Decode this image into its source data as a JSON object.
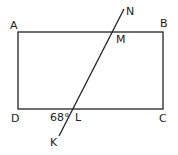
{
  "figure": {
    "type": "geometry",
    "colors": {
      "stroke": "#222222",
      "background": "#ffffff"
    },
    "rectangle": {
      "vertices": [
        {
          "label": "A",
          "x": 18,
          "y": 32
        },
        {
          "label": "B",
          "x": 163,
          "y": 32
        },
        {
          "label": "C",
          "x": 163,
          "y": 109
        },
        {
          "label": "D",
          "x": 18,
          "y": 109
        }
      ]
    },
    "transversal": {
      "start": {
        "label": "K",
        "x": 59,
        "y": 136
      },
      "end": {
        "label": "N",
        "x": 124,
        "y": 9
      },
      "intersections": [
        {
          "label": "M",
          "on_side": "AB",
          "x": 111,
          "y": 32
        },
        {
          "label": "L",
          "on_side": "DC",
          "x": 73,
          "y": 109
        }
      ]
    },
    "angle": {
      "label": "68°",
      "at": "L",
      "between": "LD and LK"
    },
    "labels": {
      "A": "A",
      "B": "B",
      "C": "C",
      "D": "D",
      "M": "M",
      "N": "N",
      "L": "L",
      "K": "K",
      "angle": "68°"
    }
  }
}
